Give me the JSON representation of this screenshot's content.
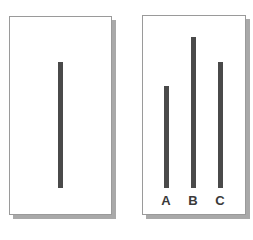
{
  "reference_card": {
    "line": {
      "top": 62,
      "bottom": 188
    }
  },
  "comparison_card": {
    "lines": [
      {
        "label": "A",
        "top": 86,
        "bottom": 188
      },
      {
        "label": "B",
        "top": 37,
        "bottom": 188
      },
      {
        "label": "C",
        "top": 62,
        "bottom": 188
      }
    ]
  },
  "colors": {
    "line": "#4a4a4a",
    "border": "#9a9a9a",
    "shadow": "#a9a9a9"
  }
}
